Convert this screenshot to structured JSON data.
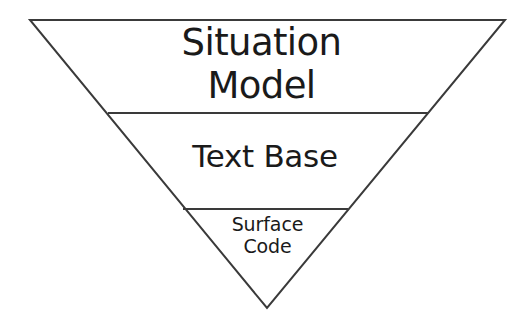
{
  "diagram": {
    "type": "inverted-pyramid",
    "background_color": "#ffffff",
    "outline_color": "#3a3a3a",
    "text_color": "#1a1a1a",
    "outline_width_px": 2,
    "divider_width_px": 2,
    "geometry": {
      "apex_top_left": [
        30,
        20
      ],
      "apex_top_right": [
        505,
        20
      ],
      "apex_bottom": [
        267,
        308
      ],
      "divider_1": {
        "y": 113,
        "x_start": 108,
        "x_end": 428
      },
      "divider_2": {
        "y": 209,
        "x_start": 183,
        "x_end": 348
      }
    },
    "layers": [
      {
        "id": "situation-model",
        "label": "Situation\nModel",
        "label_lines": [
          "Situation",
          "Model"
        ],
        "order": 1,
        "font_size_px": 37
      },
      {
        "id": "text-base",
        "label": "Text Base",
        "label_lines": [
          "Text Base"
        ],
        "order": 2,
        "font_size_px": 31
      },
      {
        "id": "surface-code",
        "label": "Surface\nCode",
        "label_lines": [
          "Surface",
          "Code"
        ],
        "order": 3,
        "font_size_px": 19
      }
    ]
  }
}
